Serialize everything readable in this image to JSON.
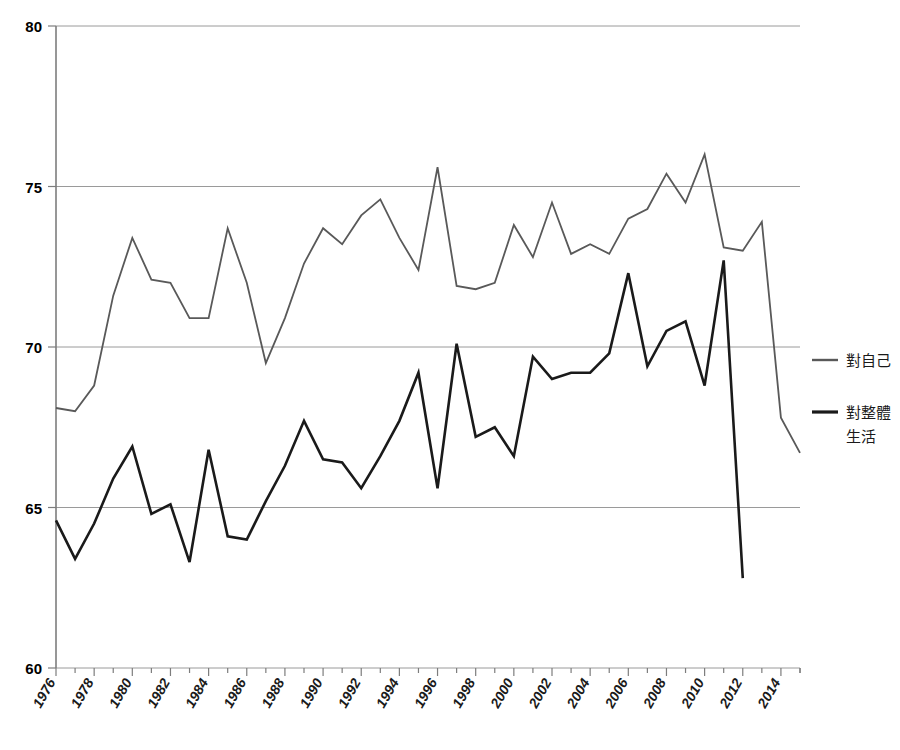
{
  "chart_data": {
    "type": "line",
    "title": "",
    "subtitle": "",
    "xlabel": "",
    "ylabel": "",
    "xlim": [
      1976,
      2015
    ],
    "ylim": [
      60,
      80
    ],
    "ytick_labels": [
      "80",
      "75",
      "70",
      "65",
      "60"
    ],
    "ytick_values": [
      80,
      75,
      70,
      65,
      60
    ],
    "grid": true,
    "grid_axis": "y",
    "legend_position": "right",
    "x": [
      1976,
      1977,
      1978,
      1979,
      1980,
      1981,
      1982,
      1983,
      1984,
      1985,
      1986,
      1987,
      1988,
      1989,
      1990,
      1991,
      1992,
      1993,
      1994,
      1995,
      1996,
      1997,
      1998,
      1999,
      2000,
      2001,
      2002,
      2003,
      2004,
      2005,
      2006,
      2007,
      2008,
      2009,
      2010,
      2011,
      2012,
      2013,
      2014,
      2015
    ],
    "xtick_labels": [
      "1976",
      "1978",
      "1980",
      "1982",
      "1984",
      "1986",
      "1988",
      "1990",
      "1992",
      "1994",
      "1996",
      "1998",
      "2000",
      "2002",
      "2004",
      "2006",
      "2008",
      "2010",
      "2012",
      "2014"
    ],
    "xtick_values": [
      1976,
      1978,
      1980,
      1982,
      1984,
      1986,
      1988,
      1990,
      1992,
      1994,
      1996,
      1998,
      2000,
      2002,
      2004,
      2006,
      2008,
      2010,
      2012,
      2014
    ],
    "series": [
      {
        "name": "對自己",
        "color": "#595959",
        "width": 1.8,
        "values": [
          68.1,
          68.0,
          68.8,
          71.6,
          73.4,
          72.1,
          72.0,
          70.9,
          70.9,
          73.7,
          72.0,
          69.5,
          70.9,
          72.6,
          73.7,
          73.2,
          74.1,
          74.6,
          73.4,
          72.4,
          75.6,
          71.9,
          71.8,
          72.0,
          73.8,
          72.8,
          74.5,
          72.9,
          73.2,
          72.9,
          74.0,
          74.3,
          75.4,
          74.5,
          76.0,
          73.1,
          73.0,
          73.9,
          67.8,
          66.7
        ]
      },
      {
        "name": "對整體生活",
        "color": "#1a1a1a",
        "width": 2.6,
        "values": [
          64.6,
          63.4,
          64.5,
          65.9,
          66.9,
          64.8,
          65.1,
          63.3,
          66.8,
          64.1,
          64.0,
          65.2,
          66.3,
          67.7,
          66.5,
          66.4,
          65.6,
          66.6,
          67.7,
          69.2,
          65.6,
          70.1,
          67.2,
          67.5,
          66.6,
          69.7,
          69.0,
          69.2,
          69.2,
          69.8,
          72.3,
          69.4,
          70.5,
          70.8,
          68.8,
          72.7,
          62.8,
          null,
          null,
          null
        ]
      }
    ],
    "legend": [
      {
        "label_lines": [
          "對自己"
        ],
        "color": "#595959",
        "width": 1.8
      },
      {
        "label_lines": [
          "對整體",
          "生活"
        ],
        "color": "#1a1a1a",
        "width": 2.6
      }
    ]
  },
  "legend": {
    "item1_line1": "對自己",
    "item2_line1": "對整體",
    "item2_line2": "生活"
  }
}
